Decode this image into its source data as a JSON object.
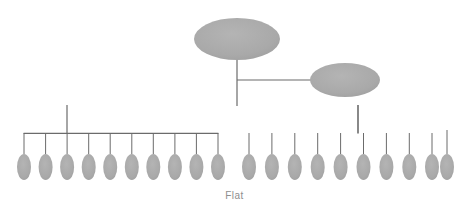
{
  "figure": {
    "caption": "Flat",
    "caption_color": "#8e8e8e",
    "background_color": "#ffffff",
    "node_fill_color": "#a9a9a9",
    "connector_color": "#6b6b6b",
    "width": 469,
    "height": 214
  },
  "chart_data": {
    "type": "diagram",
    "title": "Flat",
    "subtitle": "",
    "xlabel": "",
    "ylabel": "",
    "levels": [
      {
        "index": 0,
        "label": "root",
        "node_count": 1
      },
      {
        "index": 1,
        "label": "staff",
        "node_count": 1
      },
      {
        "index": 2,
        "label": "leaves",
        "node_count": 20
      }
    ],
    "leaf_group_counts": [
      10,
      10
    ],
    "total_nodes": 22,
    "legend": [],
    "grid": false
  },
  "nodes": {
    "root": {
      "name": "root-node",
      "cx": 237,
      "cy": 39,
      "rx": 43,
      "ry": 21
    },
    "staff": {
      "name": "staff-node",
      "cx": 345,
      "cy": 80,
      "rx": 35,
      "ry": 17
    },
    "leaf_geometry": {
      "rx": 7,
      "ry": 13,
      "cy": 167
    },
    "leaf_group_left": {
      "name": "leaf-group-left",
      "bar_y": 133,
      "bar_x1": 24,
      "bar_x2": 218,
      "stem_x": 67,
      "centers": [
        24,
        45.6,
        67.1,
        88.7,
        110.2,
        131.8,
        153.3,
        174.9,
        196.4,
        218
      ]
    },
    "leaf_group_right": {
      "name": "leaf-group-right",
      "bar_y": 133,
      "bar_x1": 249,
      "bar_x2": 432,
      "stem_x": 358,
      "centers": [
        249,
        271.9,
        294.8,
        317.7,
        340.6,
        363.5,
        386.4,
        409.3,
        432,
        447
      ],
      "detached_leaf_index": 9,
      "detached_leaf_stem_top": 130
    }
  },
  "connectors": {
    "root_stem": {
      "x": 237,
      "y1": 60,
      "y2": 105
    },
    "staff_link": {
      "y": 80,
      "x1": 237,
      "x2": 310
    },
    "level2_bar": {
      "y": 105,
      "x1": 67,
      "x2": 358
    },
    "left_group_stem": {
      "x": 67,
      "y1": 105,
      "y2": 133
    },
    "right_group_stem": {
      "x": 358,
      "y1": 105,
      "y2": 133
    },
    "leaf_stem_top": 133,
    "leaf_stem_bottom": 154
  }
}
